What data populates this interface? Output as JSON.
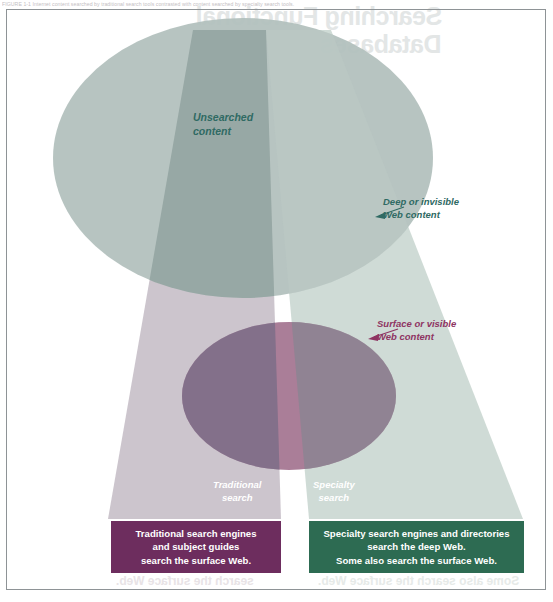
{
  "figure": {
    "caption_top": "FIGURE 1-1  Internet content searched by traditional search tools contrasted with content searched by specialty search tools.",
    "bleed_through_top_line1": "Searching Functional",
    "bleed_through_top_line2": "Databases",
    "bleed_through_bottom_left": "search the surface Web.",
    "bleed_through_bottom_right": "Some also search the surface Web."
  },
  "labels": {
    "unsearched": {
      "line1": "Unsearched",
      "line2": "content"
    },
    "deep_web": {
      "line1": "Deep or invisible",
      "line2": "Web content"
    },
    "surface_web": {
      "line1": "Surface or visible",
      "line2": "Web content"
    },
    "traditional_beam": {
      "line1": "Traditional",
      "line2": "search"
    },
    "specialty_beam": {
      "line1": "Specialty",
      "line2": "search"
    }
  },
  "callouts": {
    "traditional": {
      "line1": "Traditional search engines",
      "line2": "and subject guides",
      "line3": "search the surface Web."
    },
    "specialty": {
      "line1": "Specialty search engines and directories",
      "line2": "search the deep Web.",
      "line3": "Some also search the surface Web."
    }
  },
  "colors": {
    "deep_ellipse": "#b2bfbc",
    "surface_ellipse": "#a3738f",
    "traditional_beam": "#b9aeba",
    "specialty_beam": "#bdcdc6",
    "traditional_box": "#6d2d5e",
    "specialty_box": "#2d6b52",
    "label_teal": "#2f6a63",
    "label_magenta": "#8e3462",
    "frame_border": "#8e9396"
  }
}
